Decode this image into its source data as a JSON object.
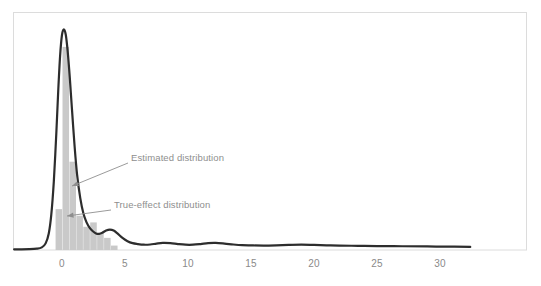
{
  "chart_data": {
    "type": "area",
    "title": "",
    "xlabel": "",
    "ylabel": "",
    "xlim": [
      -3.8,
      32.6
    ],
    "ylim": [
      0,
      1.06
    ],
    "grid": false,
    "legend_position": "none",
    "x_ticks": [
      0,
      5,
      10,
      15,
      20,
      25,
      30
    ],
    "x_tick_labels": [
      "0",
      "5",
      "10",
      "15",
      "20",
      "25",
      "30"
    ],
    "y_ticks": [],
    "y_tick_labels": [],
    "series": [
      {
        "name": "True-effect distribution",
        "type": "bar",
        "color": "#c9c9c9",
        "bar_width": 0.52,
        "x": [
          -0.25,
          0.3,
          0.85,
          1.4,
          1.95,
          2.5,
          3.05,
          3.6,
          4.15
        ],
        "values": [
          0.185,
          0.92,
          0.4,
          0.155,
          0.105,
          0.125,
          0.075,
          0.055,
          0.02
        ]
      },
      {
        "name": "Estimated distribution",
        "type": "line",
        "color": "#2d2d2d",
        "line_width": 2.2,
        "x": [
          -3.8,
          -2.6,
          -2.0,
          -1.6,
          -1.3,
          -1.05,
          -0.85,
          -0.65,
          -0.45,
          -0.3,
          -0.15,
          0.0,
          0.15,
          0.3,
          0.45,
          0.62,
          0.8,
          1.0,
          1.2,
          1.45,
          1.7,
          1.95,
          2.2,
          2.45,
          2.7,
          2.95,
          3.2,
          3.5,
          3.8,
          4.1,
          4.4,
          4.8,
          5.2,
          5.6,
          6.0,
          6.5,
          7.0,
          7.5,
          8.0,
          8.6,
          9.2,
          9.8,
          10.4,
          11.0,
          11.6,
          12.2,
          12.9,
          13.6,
          14.3,
          15.0,
          16.0,
          17.0,
          18.0,
          19.0,
          20.0,
          21.0,
          22.0,
          23.5,
          25.0,
          27.0,
          29.0,
          31.0,
          32.4
        ],
        "values": [
          0.003,
          0.004,
          0.006,
          0.012,
          0.03,
          0.075,
          0.16,
          0.31,
          0.53,
          0.72,
          0.88,
          0.975,
          1.0,
          0.975,
          0.9,
          0.78,
          0.63,
          0.47,
          0.34,
          0.235,
          0.165,
          0.125,
          0.1,
          0.085,
          0.075,
          0.073,
          0.078,
          0.088,
          0.092,
          0.088,
          0.075,
          0.055,
          0.04,
          0.031,
          0.027,
          0.024,
          0.025,
          0.029,
          0.032,
          0.031,
          0.027,
          0.024,
          0.024,
          0.027,
          0.031,
          0.032,
          0.029,
          0.025,
          0.022,
          0.021,
          0.02,
          0.021,
          0.023,
          0.024,
          0.023,
          0.021,
          0.02,
          0.019,
          0.018,
          0.017,
          0.016,
          0.015,
          0.014
        ]
      }
    ],
    "annotations": [
      {
        "text": "Estimated distribution",
        "label_x": 131,
        "label_y": 152,
        "arrow_from_x": 128,
        "arrow_from_y": 163,
        "arrow_to_x": 72,
        "arrow_to_y": 186,
        "color": "#8e8e8e"
      },
      {
        "text": "True-effect distribution",
        "label_x": 114,
        "label_y": 199,
        "arrow_from_x": 111,
        "arrow_from_y": 210,
        "arrow_to_x": 67,
        "arrow_to_y": 216,
        "color": "#8e8e8e"
      }
    ],
    "frame": {
      "color": "#dcdcdc",
      "left": 13,
      "top": 12,
      "right": 527,
      "bottom": 250
    },
    "baseline_y_pixel": 250
  }
}
